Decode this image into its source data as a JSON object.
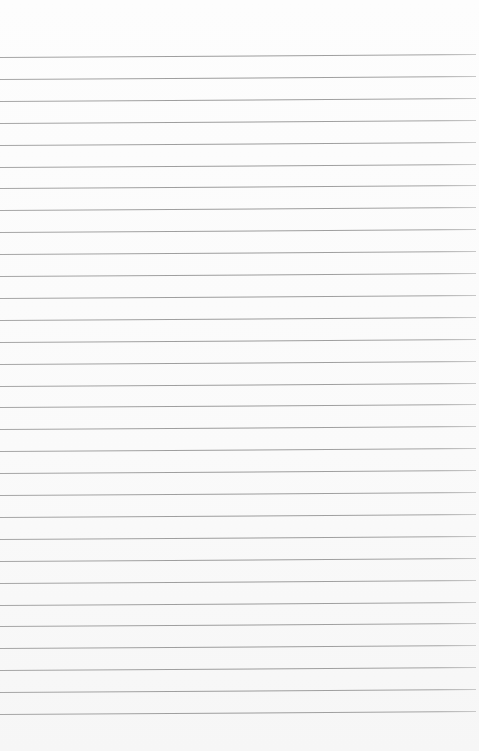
{
  "paper": {
    "type": "lined-paper",
    "background_color": "#fbfbfb",
    "line_color": "#9e9e9e",
    "line_count": 31,
    "first_line_y": 57,
    "line_spacing": 21.9
  }
}
